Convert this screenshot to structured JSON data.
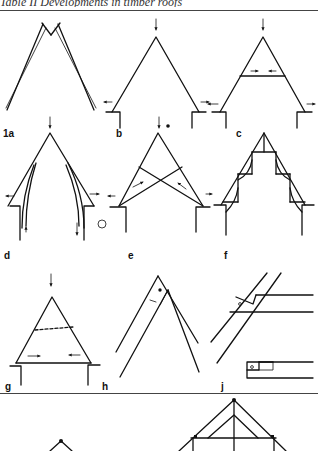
{
  "page": {
    "title": "Table II  Developments in timber roofs"
  },
  "figures": [
    {
      "id": "1a",
      "label": "1a",
      "description": "Two crossed rafters forming an A-frame, pushing outward"
    },
    {
      "id": "b",
      "label": "b",
      "description": "Couple roof on walls with vertical load arrow and outward thrust arrows"
    },
    {
      "id": "c",
      "label": "c",
      "description": "Collar-beam roof with tie arrows pointing inward"
    },
    {
      "id": "d",
      "label": "d",
      "description": "Arch-braced roof with curved braces transferring load down walls"
    },
    {
      "id": "e",
      "label": "e",
      "description": "Scissor-braced roof with crossing braces"
    },
    {
      "id": "f",
      "label": "f",
      "description": "Hammer-beam roof with stepped brackets and curved braces"
    },
    {
      "id": "g",
      "label": "g",
      "description": "Tie-beam roof with dashed collar and inward arrows"
    },
    {
      "id": "h",
      "label": "h",
      "description": "Rafter apex joint detail with peg"
    },
    {
      "id": "j",
      "label": "j",
      "description": "Rafter-to-beam joint detail with peg and notched tenon"
    }
  ],
  "bottom_row": {
    "description": "Partially visible truss diagrams (king-post truss)"
  }
}
